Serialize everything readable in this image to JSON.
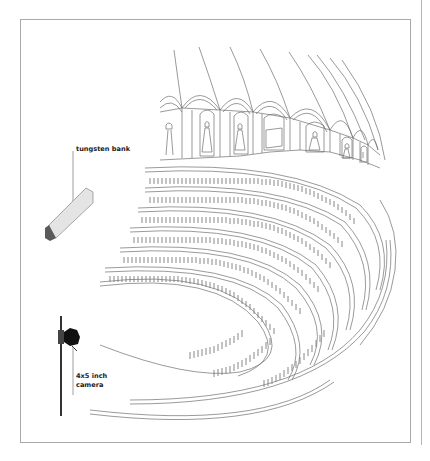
{
  "figure": {
    "type": "lighting-setup-diagram",
    "labels": {
      "light": "tungsten bank",
      "camera_line1": "4x5 inch",
      "camera_line2": "camera"
    },
    "colors": {
      "line": "#6e6e6e",
      "frame": "#a9a9a9",
      "light_fill": "#e4e4e4",
      "light_end": "#5a5a5a",
      "camera_body": "#111111",
      "text": "#222222"
    }
  }
}
